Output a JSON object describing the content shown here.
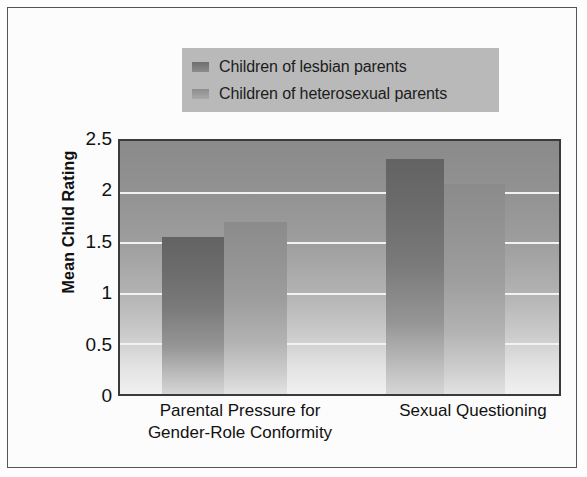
{
  "chart_data": {
    "type": "bar",
    "title": "",
    "subtitle": "",
    "xlabel": "",
    "ylabel": "Mean Child Rating",
    "ylim": [
      0,
      2.5
    ],
    "yticks": [
      "0",
      "0.5",
      "1",
      "1.5",
      "2",
      "2.5"
    ],
    "ytick_values": [
      0,
      0.5,
      1,
      1.5,
      2,
      2.5
    ],
    "grid": true,
    "grid_axis": "y",
    "legend_position": "top-center",
    "categories": [
      "Parental Pressure for\nGender-Role Conformity",
      "Sexual Questioning"
    ],
    "series": [
      {
        "name": "Children of lesbian parents",
        "color": "#6e6e6e",
        "values": [
          1.55,
          2.32
        ]
      },
      {
        "name": "Children of heterosexual parents",
        "color": "#9a9a9a",
        "values": [
          1.7,
          2.08
        ]
      }
    ]
  },
  "legend": {
    "items": [
      {
        "label": "Children of lesbian parents",
        "swatch": "dark"
      },
      {
        "label": "Children of heterosexual parents",
        "swatch": "light"
      }
    ],
    "background_color": "#b9b9b9"
  },
  "axes": {
    "y_title": "Mean Child Rating",
    "y_ticks": [
      "2.5",
      "2",
      "1.5",
      "1",
      "0.5",
      "0"
    ],
    "x_categories": [
      "Parental Pressure for\nGender-Role Conformity",
      "Sexual Questioning"
    ]
  },
  "colors": {
    "plot_background_top": "#8a8a8a",
    "plot_background_bottom": "#f0f0f0",
    "bar_dark": "#6e6e6e",
    "bar_light": "#9a9a9a",
    "gridline": "#f2f2f2",
    "frame": "#555555",
    "text": "#111111"
  }
}
